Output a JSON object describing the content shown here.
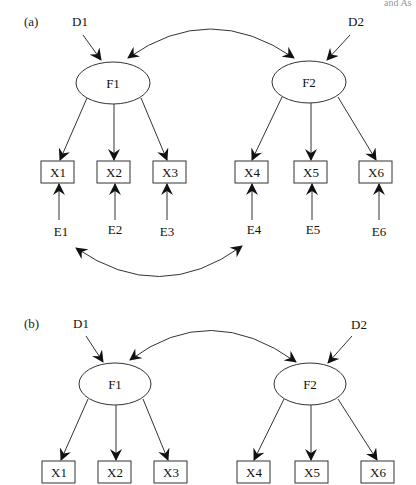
{
  "cropped_text": "and As",
  "panel_a": {
    "label": "(a)",
    "disturbances": [
      "D1",
      "D2"
    ],
    "factors": [
      "F1",
      "F2"
    ],
    "indicators": [
      "X1",
      "X2",
      "X3",
      "X4",
      "X5",
      "X6"
    ],
    "errors": [
      "E1",
      "E2",
      "E3",
      "E4",
      "E5",
      "E6"
    ],
    "correlations": [
      "D1/F1 <-> F2",
      "E1 <-> E4"
    ]
  },
  "panel_b": {
    "label": "(b)",
    "disturbances": [
      "D1",
      "D2"
    ],
    "factors": [
      "F1",
      "F2"
    ],
    "indicators": [
      "X1",
      "X2",
      "X3",
      "X4",
      "X5",
      "X6"
    ],
    "correlations": [
      "F1 <-> F2"
    ]
  },
  "colors": {
    "line": "#333333",
    "background": "#ffffff",
    "text": "#111111"
  }
}
